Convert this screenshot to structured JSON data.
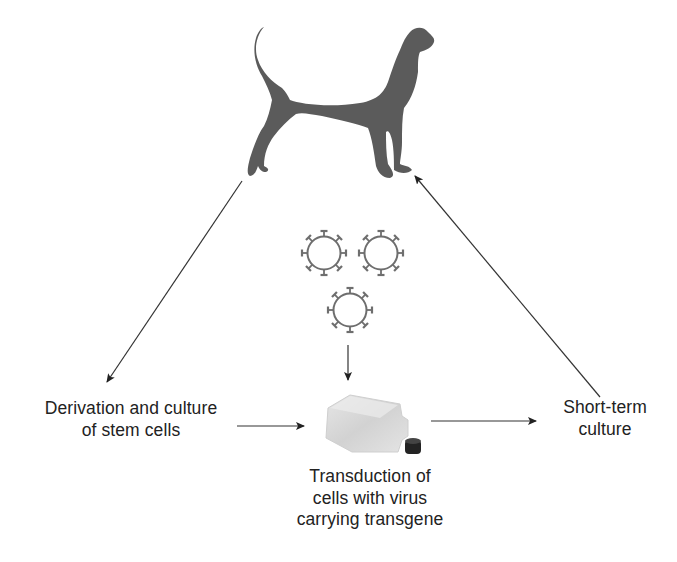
{
  "diagram": {
    "colors": {
      "silhouette": "#5a5a5a",
      "arrow": "#333333",
      "text": "#222222",
      "virus": "#6e6e6e",
      "flask_body": "#d8d8d8",
      "flask_cap": "#222222",
      "background": "#ffffff"
    },
    "nodes": {
      "dog": {
        "icon": "dog-silhouette-icon",
        "label": "Dog"
      },
      "viruses": {
        "icon": "virus-icon",
        "count": 3
      },
      "flask": {
        "icon": "culture-flask-icon"
      },
      "left": {
        "lines": [
          "Derivation and culture",
          "of stem cells"
        ]
      },
      "right": {
        "lines": [
          "Short-term",
          "culture"
        ]
      },
      "bottom": {
        "lines": [
          "Transduction of",
          "cells with virus",
          "carrying transgene"
        ]
      }
    },
    "edges": [
      {
        "from": "dog",
        "to": "left",
        "label": "harvest"
      },
      {
        "from": "left",
        "to": "flask"
      },
      {
        "from": "viruses",
        "to": "flask"
      },
      {
        "from": "flask",
        "to": "right"
      },
      {
        "from": "right",
        "to": "dog",
        "label": "reinfusion"
      }
    ]
  }
}
